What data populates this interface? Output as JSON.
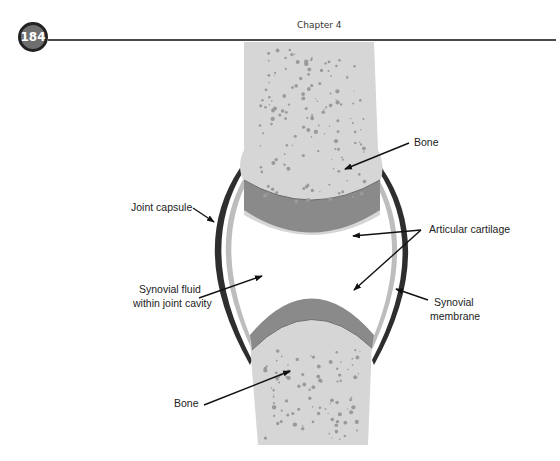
{
  "header": {
    "page_number": "184",
    "chapter_title": "Chapter 4"
  },
  "figure": {
    "labels": {
      "bone_top": "Bone",
      "joint_capsule": "Joint capsule",
      "articular_cartilage": "Articular cartilage",
      "synovial_fluid_line1": "Synovial fluid",
      "synovial_fluid_line2": "within joint cavity",
      "synovial_membrane_line1": "Synovial",
      "synovial_membrane_line2": "membrane",
      "bone_bottom": "Bone"
    },
    "colors": {
      "bone": "#d6d6d6",
      "bone_spots": "#9a9a9a",
      "cartilage": "#8a8a8a",
      "capsule": "#2e2e2e",
      "membrane": "#bdbdbd",
      "cavity": "#ffffff"
    }
  }
}
